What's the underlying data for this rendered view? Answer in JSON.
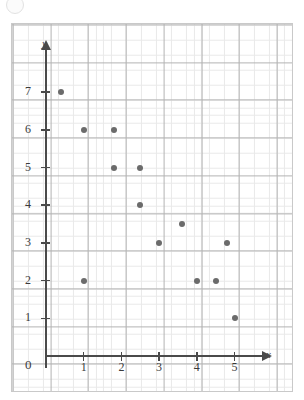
{
  "figure": {
    "title": "",
    "x_axis_label": "x",
    "y_axis_label": "y",
    "origin_label": "0"
  },
  "chart_data": {
    "type": "scatter",
    "title": "",
    "xlabel": "x",
    "ylabel": "y",
    "xlim": [
      0,
      5.8
    ],
    "ylim": [
      0,
      7.8
    ],
    "grid": true,
    "grid_minor_subdivisions": 5,
    "legend": null,
    "xticks": [
      0,
      1,
      2,
      3,
      4,
      5
    ],
    "yticks": [
      1,
      2,
      3,
      4,
      5,
      6,
      7
    ],
    "xtick_labels": [
      "0",
      "1",
      "2",
      "3",
      "4",
      "5"
    ],
    "ytick_labels": [
      "1",
      "2",
      "3",
      "4",
      "5",
      "6",
      "7"
    ],
    "point_count": 13,
    "points": [
      {
        "x": 0.4,
        "y": 7
      },
      {
        "x": 1.0,
        "y": 6
      },
      {
        "x": 1.8,
        "y": 6
      },
      {
        "x": 1.8,
        "y": 5
      },
      {
        "x": 2.5,
        "y": 5
      },
      {
        "x": 2.5,
        "y": 4
      },
      {
        "x": 3.6,
        "y": 3.5
      },
      {
        "x": 3.0,
        "y": 3
      },
      {
        "x": 4.8,
        "y": 3
      },
      {
        "x": 1.0,
        "y": 2
      },
      {
        "x": 4.0,
        "y": 2
      },
      {
        "x": 4.5,
        "y": 2
      },
      {
        "x": 5.0,
        "y": 1
      }
    ],
    "colors": {
      "marker": "#6b6b6b",
      "axis": "#4a4a4a",
      "grid_major": "#b3b3b3",
      "grid_minor": "#e9e9e9",
      "frame": "#c9c9c9",
      "background": "#ffffff"
    }
  }
}
